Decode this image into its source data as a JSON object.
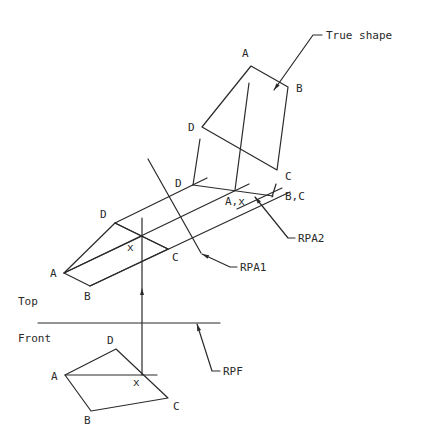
{
  "diagram": {
    "views": {
      "top": {
        "label": "Top",
        "label_pos": [
          18,
          305
        ],
        "polygon": [
          [
            64,
            273
          ],
          [
            115,
            223
          ],
          [
            168,
            249
          ],
          [
            90,
            286
          ]
        ],
        "vertices": [
          {
            "label": "A",
            "pos": [
              50,
              277
            ]
          },
          {
            "label": "D",
            "pos": [
              100,
              218
            ]
          },
          {
            "label": "C",
            "pos": [
              172,
              261
            ]
          },
          {
            "label": "B",
            "pos": [
              84,
              300
            ]
          }
        ],
        "construction_lines": [
          [
            [
              64,
              273
            ],
            [
              142,
              236
            ]
          ],
          [
            [
              115,
              223
            ],
            [
              168,
              249
            ]
          ]
        ],
        "point_x": {
          "label": "x",
          "pos": [
            127,
            251
          ]
        }
      },
      "front": {
        "label": "Front",
        "label_pos": [
          18,
          342
        ],
        "polygon": [
          [
            65,
            375
          ],
          [
            116,
            349
          ],
          [
            168,
            398
          ],
          [
            91,
            411
          ]
        ],
        "vertices": [
          {
            "label": "A",
            "pos": [
              51,
              380
            ]
          },
          {
            "label": "D",
            "pos": [
              107,
              344
            ]
          },
          {
            "label": "C",
            "pos": [
              173,
              410
            ]
          },
          {
            "label": "B",
            "pos": [
              84,
              424
            ]
          }
        ],
        "construction_lines": [
          [
            [
              65,
              375
            ],
            [
              157,
              375
            ]
          ]
        ],
        "point_x": {
          "label": "x",
          "pos": [
            133,
            386
          ]
        }
      },
      "first_auxiliary": {
        "edge_line": [
          [
            193,
            185
          ],
          [
            273,
            196
          ]
        ],
        "vertices": [
          {
            "label": "D",
            "pos": [
              175,
              187
            ]
          },
          {
            "label": "A,x",
            "pos": [
              225,
              205
            ]
          },
          {
            "label": "B,C",
            "pos": [
              285,
              200
            ]
          }
        ],
        "projectors": [
          [
            [
              115,
              223
            ],
            [
              207,
              178
            ]
          ],
          [
            [
              64,
              273
            ],
            [
              249,
              184
            ]
          ],
          [
            [
              90,
              286
            ],
            [
              290,
              192
            ]
          ]
        ],
        "ticks": [
          [
            [
              276,
              184
            ],
            [
              272,
              197
            ]
          ]
        ]
      },
      "true_shape": {
        "polygon": [
          [
            251,
            66
          ],
          [
            288,
            87
          ],
          [
            277,
            170
          ],
          [
            202,
            127
          ]
        ],
        "vertices": [
          {
            "label": "A",
            "pos": [
              242,
              57
            ]
          },
          {
            "label": "B",
            "pos": [
              296,
              92
            ]
          },
          {
            "label": "C",
            "pos": [
              285,
              180
            ]
          },
          {
            "label": "D",
            "pos": [
              188,
              131
            ]
          }
        ],
        "projectors": [
          [
            [
              193,
              185
            ],
            [
              200,
              139
            ]
          ],
          [
            [
              235,
              190
            ],
            [
              249,
              83
            ]
          ]
        ]
      }
    },
    "reference_planes": [
      {
        "name": "RPF",
        "label": "RPF",
        "line": [
          [
            38,
            323
          ],
          [
            220,
            323
          ]
        ],
        "leader": [
          [
            197,
            324
          ],
          [
            212,
            371
          ],
          [
            220,
            371
          ]
        ],
        "label_pos": [
          223,
          375
        ]
      },
      {
        "name": "RPA1",
        "label": "RPA1",
        "line": [
          [
            148,
            159
          ],
          [
            201,
            253
          ]
        ],
        "leader": [
          [
            202,
            254
          ],
          [
            230,
            267
          ],
          [
            237,
            267
          ]
        ],
        "label_pos": [
          240,
          271
        ]
      },
      {
        "name": "RPA2",
        "label": "RPA2",
        "line": [
          [
            237,
            209
          ],
          [
            282,
            188
          ]
        ],
        "leader": [
          [
            255,
            197
          ],
          [
            288,
            238
          ],
          [
            295,
            238
          ]
        ],
        "label_pos": [
          298,
          242
        ]
      }
    ],
    "callouts": [
      {
        "label": "True shape",
        "leader": [
          [
            274,
            90
          ],
          [
            313,
            35
          ],
          [
            322,
            35
          ]
        ],
        "label_pos": [
          326,
          39
        ]
      }
    ],
    "vertical_projector": {
      "line": [
        [
          142,
          218
        ],
        [
          142,
          375
        ]
      ],
      "arrow_at": [
        142,
        292
      ]
    }
  }
}
